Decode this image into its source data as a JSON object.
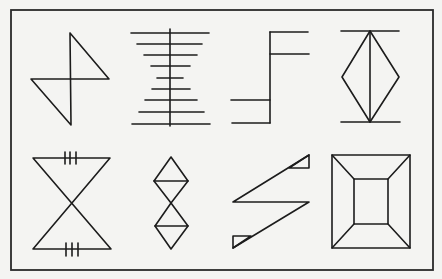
{
  "figure": {
    "frame": {
      "x": 11,
      "y": 10,
      "width": 422,
      "height": 260
    },
    "stroke_color": "#1c1c1c",
    "background_color": "#f4f4f2",
    "panels": [
      {
        "id": "bowtie-z",
        "row": 1,
        "col": 1
      },
      {
        "id": "ladder",
        "row": 1,
        "col": 2
      },
      {
        "id": "step",
        "row": 1,
        "col": 3
      },
      {
        "id": "diamond-bars",
        "row": 1,
        "col": 4
      },
      {
        "id": "hourglass-ticks",
        "row": 2,
        "col": 1
      },
      {
        "id": "double-diamond",
        "row": 2,
        "col": 2
      },
      {
        "id": "z-triangles",
        "row": 2,
        "col": 3
      },
      {
        "id": "frustum-square",
        "row": 2,
        "col": 4
      }
    ]
  }
}
